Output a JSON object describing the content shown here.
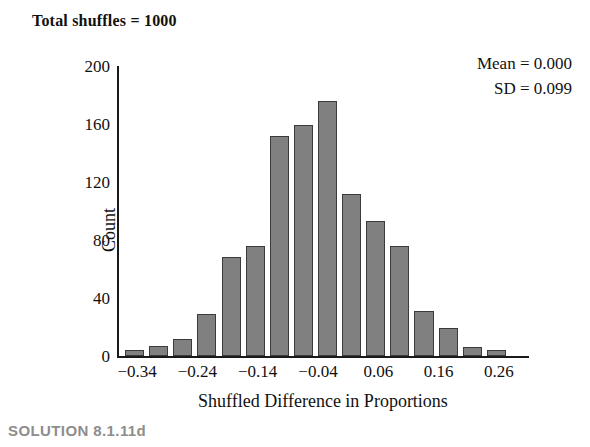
{
  "title": "Total shuffles = 1000",
  "annotations": {
    "mean_line": "Mean = 0.000",
    "sd_line": "SD = 0.099"
  },
  "caption": "SOLUTION 8.1.11d",
  "colors": {
    "bar_fill": "#808080",
    "bar_stroke": "#3b3b3b",
    "axis": "#1a1a1a",
    "caption": "#8d8d8d",
    "background": "#ffffff"
  },
  "chart_data": {
    "type": "bar",
    "title": "Total shuffles = 1000",
    "xlabel": "Shuffled Difference in Proportions",
    "ylabel": "Count",
    "grid": false,
    "legend": null,
    "ylim": [
      0,
      200
    ],
    "ytick_labels": [
      "200",
      "160",
      "120",
      "80",
      "40",
      "0"
    ],
    "ytick_values": [
      200,
      160,
      120,
      80,
      40,
      0
    ],
    "xlim": [
      -0.37,
      0.31
    ],
    "xtick_labels": [
      "−0.34",
      "−0.24",
      "−0.14",
      "−0.04",
      "0.06",
      "0.16",
      "0.26"
    ],
    "xtick_values": [
      -0.34,
      -0.24,
      -0.14,
      -0.04,
      0.06,
      0.16,
      0.26
    ],
    "bin_width": 0.04,
    "categories": [
      -0.34,
      -0.3,
      -0.26,
      -0.22,
      -0.18,
      -0.14,
      -0.1,
      -0.06,
      -0.02,
      0.02,
      0.06,
      0.1,
      0.14,
      0.18,
      0.22,
      0.26
    ],
    "values": [
      4,
      7,
      12,
      29,
      68,
      76,
      152,
      159,
      176,
      112,
      93,
      76,
      31,
      19,
      6,
      4
    ],
    "annotations": [
      "Mean = 0.000",
      "SD = 0.099"
    ],
    "stats": {
      "total_shuffles": 1000,
      "mean": 0.0,
      "sd": 0.099
    }
  }
}
